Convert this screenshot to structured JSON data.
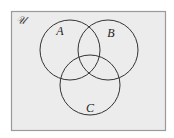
{
  "diagram": {
    "type": "venn",
    "universe": {
      "label": "𝒰",
      "rect": {
        "x": 11.5,
        "y": 11.5,
        "width": 154,
        "height": 119
      },
      "fill": "#ececec",
      "stroke": "#9a9a9a"
    },
    "sets": [
      {
        "label": "A",
        "cx": 70,
        "cy": 50,
        "r": 30,
        "label_x": 60,
        "label_y": 35
      },
      {
        "label": "B",
        "cx": 108,
        "cy": 50,
        "r": 30,
        "label_x": 111,
        "label_y": 37
      },
      {
        "label": "C",
        "cx": 90,
        "cy": 85,
        "r": 30,
        "label_x": 90,
        "label_y": 112
      }
    ],
    "stroke_color": "#333333"
  }
}
